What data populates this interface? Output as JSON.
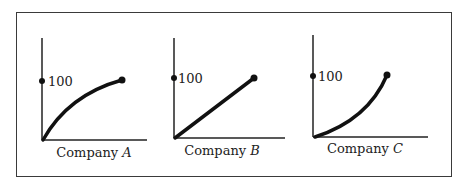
{
  "panels": [
    {
      "label_prefix": "Company ",
      "label_var": "A",
      "tick_label": "100",
      "shape": "concave"
    },
    {
      "label_prefix": "Company ",
      "label_var": "B",
      "tick_label": "100",
      "shape": "linear"
    },
    {
      "label_prefix": "Company ",
      "label_var": "C",
      "tick_label": "100",
      "shape": "convex"
    }
  ]
}
